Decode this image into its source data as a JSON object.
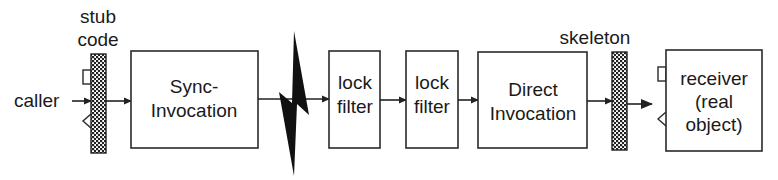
{
  "diagram": {
    "type": "flow",
    "colors": {
      "stroke": "#2a2a2a",
      "text": "#1a1a1a",
      "bolt": "#111111",
      "background": "#ffffff"
    },
    "caller": {
      "label": "caller"
    },
    "stub": {
      "label_line1": "stub",
      "label_line2": "code"
    },
    "nodes": {
      "sync": {
        "line1": "Sync-",
        "line2": "Invocation"
      },
      "lock1": {
        "line1": "lock",
        "line2": "filter"
      },
      "lock2": {
        "line1": "lock",
        "line2": "filter"
      },
      "direct": {
        "line1": "Direct",
        "line2": "Invocation"
      },
      "receiver": {
        "line1": "receiver",
        "line2": "(real",
        "line3": "object)"
      }
    },
    "skeleton": {
      "label": "skeleton"
    },
    "edges": [
      [
        "caller",
        "stub"
      ],
      [
        "stub",
        "sync"
      ],
      [
        "sync",
        "lock1"
      ],
      [
        "lock1",
        "lock2"
      ],
      [
        "lock2",
        "direct"
      ],
      [
        "direct",
        "skeleton"
      ],
      [
        "skeleton",
        "receiver"
      ]
    ],
    "network_break_icon": "lightning-bolt"
  }
}
